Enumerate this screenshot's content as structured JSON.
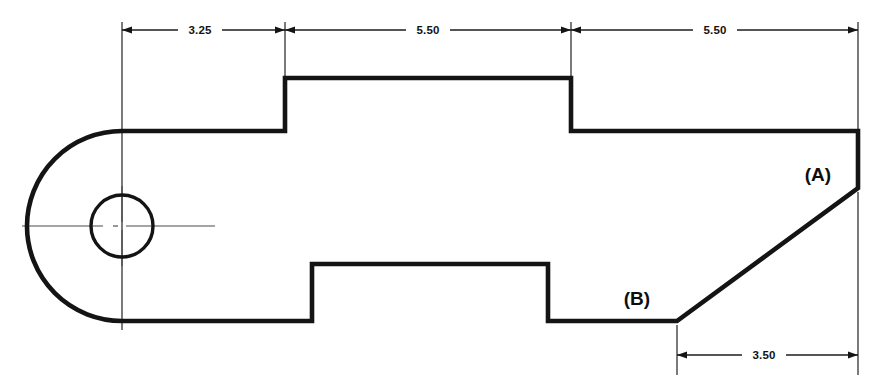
{
  "drawing": {
    "title": "Mechanical part orthographic outline with dimensions",
    "units_implied": "inches",
    "line_color": "#141414",
    "centerline_color": "#4a4a4a",
    "background": "#ffffff",
    "dimensions": [
      {
        "id": "dim-top-1",
        "label": "3.25",
        "position": "top",
        "from_x": 122,
        "to_x": 285,
        "line_y": 30
      },
      {
        "id": "dim-top-2",
        "label": "5.50",
        "position": "top",
        "from_x": 285,
        "to_x": 571,
        "line_y": 30
      },
      {
        "id": "dim-top-3",
        "label": "5.50",
        "position": "top",
        "from_x": 571,
        "to_x": 858,
        "line_y": 30
      },
      {
        "id": "dim-bottom-1",
        "label": "3.50",
        "position": "bottom",
        "from_x": 677,
        "to_x": 858,
        "line_y": 355
      }
    ],
    "point_labels": [
      {
        "id": "label-a",
        "text": "(A)",
        "x": 818,
        "y": 181
      },
      {
        "id": "label-b",
        "text": "(B)",
        "x": 637,
        "y": 305
      }
    ],
    "features": {
      "left_arc": {
        "center_x": 122,
        "center_y": 226,
        "radius": 95
      },
      "hole": {
        "center_x": 122,
        "center_y": 226,
        "radius": 31
      },
      "top_step": {
        "left_x": 285,
        "right_x": 571,
        "top_y": 78,
        "base_y": 131
      },
      "bottom_notch": {
        "left_x": 312,
        "right_x": 548,
        "top_y": 264,
        "base_y": 321
      },
      "right_edge_x": 858,
      "point_a": {
        "x": 858,
        "y": 188
      },
      "point_b": {
        "x": 677,
        "y": 321
      }
    }
  }
}
